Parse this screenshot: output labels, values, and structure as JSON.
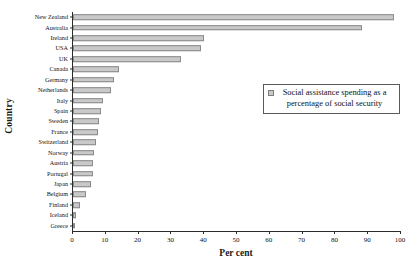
{
  "chart_data": {
    "type": "bar",
    "orientation": "horizontal",
    "title": "",
    "xlabel": "Per cent",
    "ylabel": "Country",
    "xlim": [
      0,
      100
    ],
    "xticks": [
      0,
      10,
      20,
      30,
      40,
      50,
      60,
      70,
      80,
      90,
      100
    ],
    "grid": false,
    "legend_position": "inside-upper-right",
    "legend": [
      "Social assistance spending as a percentage of social security"
    ],
    "series_name": "Social assistance spending as a percentage of social security",
    "categories": [
      "New Zealand",
      "Australia",
      "Ireland",
      "USA",
      "UK",
      "Canada",
      "Germany",
      "Netherlands",
      "Italy",
      "Spain",
      "Sweden",
      "France",
      "Switzerland",
      "Norway",
      "Austria",
      "Portugal",
      "Japan",
      "Belgium",
      "Finland",
      "Iceland",
      "Greece"
    ],
    "values": [
      98,
      88,
      40,
      39,
      33,
      14,
      12.5,
      11.5,
      9,
      8.5,
      8,
      7.5,
      7,
      6.5,
      6.2,
      6,
      5.5,
      4,
      2,
      1,
      0.7
    ]
  },
  "axis": {
    "x_title": "Per cent",
    "y_title": "Country"
  },
  "legend": {
    "swatch": "legend-swatch-icon",
    "label": "Social assistance spending as a percentage of social security"
  },
  "colors": {
    "bar_fill": "#c9c9c9",
    "bar_border": "#8a8a8a",
    "axis": "#2b2b2b",
    "text": "#111111",
    "background": "#ffffff"
  }
}
